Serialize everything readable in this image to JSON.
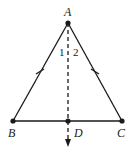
{
  "diagram": {
    "type": "geometry",
    "points": {
      "A": {
        "label": "A",
        "x": 68,
        "y": 23
      },
      "B": {
        "label": "B",
        "x": 13,
        "y": 121
      },
      "C": {
        "label": "C",
        "x": 122,
        "y": 121
      },
      "D": {
        "label": "D",
        "x": 68,
        "y": 121
      }
    },
    "angle_labels": {
      "angle1": "1",
      "angle2": "2"
    },
    "segments": [
      "AB",
      "AC",
      "BC"
    ],
    "dashed_ray": {
      "from": "A",
      "through": "D",
      "arrow": true
    },
    "equal_marks": [
      "AB",
      "AC"
    ],
    "colors": {
      "stroke": "#1a1a1a",
      "background": "#ffffff"
    }
  }
}
